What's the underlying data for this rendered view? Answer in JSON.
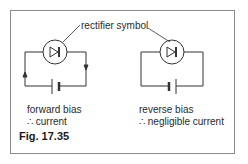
{
  "annotation": {
    "label": "rectifier symbol"
  },
  "circuits": [
    {
      "name": "forward",
      "caption_line1": "forward bias",
      "caption_line2": "∴ current"
    },
    {
      "name": "reverse",
      "caption_line1": "reverse bias",
      "caption_line2": "∴ negligible current"
    }
  ],
  "figure": {
    "label": "Fig. 17.35"
  },
  "colors": {
    "line": "#333333",
    "frame": "#8a8a8a",
    "text": "#2a2a2a"
  }
}
